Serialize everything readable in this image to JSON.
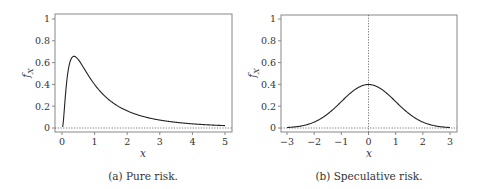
{
  "chart_data": [
    {
      "type": "line",
      "panel": "a",
      "caption": "(a) Pure risk.",
      "xlabel": "x",
      "ylabel": "f_X",
      "xlim": [
        -0.2,
        5.2
      ],
      "ylim": [
        -0.05,
        1.03
      ],
      "xticks": [
        0,
        1,
        2,
        3,
        4,
        5
      ],
      "yticks": [
        0,
        0.2,
        0.4,
        0.6,
        0.8,
        1
      ],
      "ytick_labels": [
        "0",
        "0.2",
        "0.4",
        "0.6",
        "0.8",
        "1"
      ],
      "distribution": "lognormal",
      "params": {
        "mu": 0,
        "sigma": 1
      },
      "series": [
        {
          "name": "f_X",
          "x": [
            0.05,
            0.1,
            0.2,
            0.3,
            0.368,
            0.5,
            0.75,
            1,
            1.5,
            2,
            2.5,
            3,
            3.5,
            4,
            4.5,
            5
          ],
          "values": [
            0.0,
            0.04,
            0.33,
            0.64,
            0.66,
            0.63,
            0.52,
            0.4,
            0.25,
            0.16,
            0.1,
            0.07,
            0.05,
            0.04,
            0.03,
            0.02
          ]
        }
      ],
      "reference_lines": [
        {
          "orientation": "horizontal",
          "value": 0,
          "style": "dotted"
        }
      ],
      "grid": false
    },
    {
      "type": "line",
      "panel": "b",
      "caption": "(b) Speculative risk.",
      "xlabel": "x",
      "ylabel": "f_X",
      "xlim": [
        -3.2,
        3.3
      ],
      "ylim": [
        -0.05,
        1.03
      ],
      "xticks": [
        -3,
        -2,
        -1,
        0,
        1,
        2,
        3
      ],
      "xtick_labels": [
        "−3",
        "−2",
        "−1",
        "0",
        "1",
        "2",
        "3"
      ],
      "yticks": [
        0,
        0.2,
        0.4,
        0.6,
        0.8,
        1
      ],
      "ytick_labels": [
        "0",
        "0.2",
        "0.4",
        "0.6",
        "0.8",
        "1"
      ],
      "distribution": "normal",
      "params": {
        "mu": 0,
        "sigma": 1
      },
      "series": [
        {
          "name": "f_X",
          "x": [
            -3,
            -2.5,
            -2,
            -1.5,
            -1,
            -0.5,
            0,
            0.5,
            1,
            1.5,
            2,
            2.5,
            3
          ],
          "values": [
            0.004,
            0.018,
            0.054,
            0.13,
            0.24,
            0.35,
            0.4,
            0.35,
            0.24,
            0.13,
            0.054,
            0.018,
            0.004
          ]
        }
      ],
      "reference_lines": [
        {
          "orientation": "horizontal",
          "value": 0,
          "style": "dotted"
        },
        {
          "orientation": "vertical",
          "value": 0,
          "style": "dotted"
        }
      ],
      "grid": false
    }
  ],
  "layout": {
    "panels": [
      {
        "frame": {
          "left": 55,
          "top": 14,
          "right": 232,
          "bottom": 132
        },
        "xmap": {
          "v0": 0,
          "p0": 62,
          "v1": 5,
          "p1": 225
        },
        "ymap": {
          "v0": 0,
          "p0": 128,
          "v1": 1,
          "p1": 19
        },
        "ylabel_pos": [
          30,
          73
        ],
        "xlabel_pos": [
          143,
          157
        ],
        "caption_pos": [
          143,
          180
        ]
      },
      {
        "frame": {
          "left": 281,
          "top": 15,
          "right": 457,
          "bottom": 132
        },
        "xmap": {
          "v0": -3,
          "p0": 287,
          "v1": 3,
          "p1": 450
        },
        "ymap": {
          "v0": 0,
          "p0": 128,
          "v1": 1,
          "p1": 19
        },
        "ylabel_pos": [
          256,
          73
        ],
        "xlabel_pos": [
          369,
          157
        ],
        "caption_pos": [
          369,
          180
        ]
      }
    ],
    "colors": {
      "curve": "#222222",
      "frame": "#888888",
      "ref": "#555555",
      "text": "#333333"
    }
  }
}
